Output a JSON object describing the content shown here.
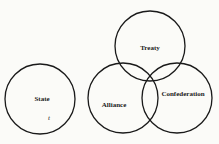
{
  "diagram": {
    "type": "venn",
    "circles": [
      {
        "id": "state",
        "label": "State",
        "cx": 40,
        "cy": 99,
        "r": 35
      },
      {
        "id": "treaty",
        "label": "Treaty",
        "cx": 150,
        "cy": 46,
        "r": 35
      },
      {
        "id": "alliance",
        "label": "Alliance",
        "cx": 123,
        "cy": 98,
        "r": 35
      },
      {
        "id": "confederation",
        "label": "Confederation",
        "cx": 177,
        "cy": 98,
        "r": 35
      }
    ],
    "annotation": "t",
    "stroke_color": "#1a1a1a",
    "background": "#fbfbf8"
  }
}
